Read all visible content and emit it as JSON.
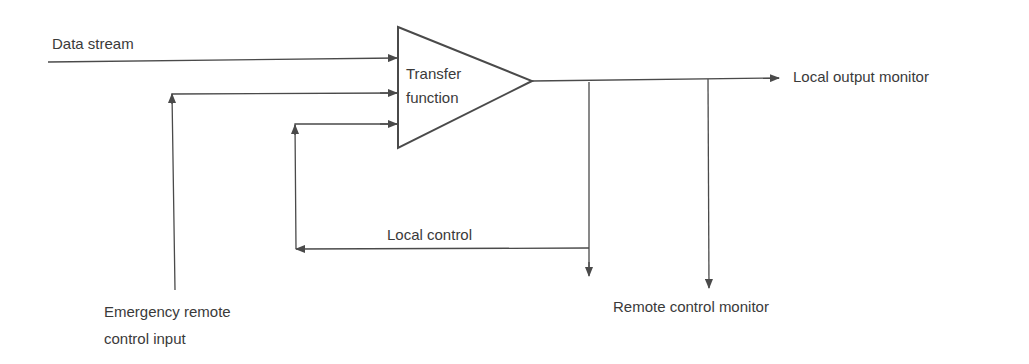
{
  "diagram": {
    "colors": {
      "line": "#4a4a4a",
      "text": "#3a3a3a",
      "background": "#ffffff"
    },
    "block": {
      "shape": "triangle",
      "label_line1": "Transfer",
      "label_line2": "function"
    },
    "labels": {
      "data_stream": "Data stream",
      "local_output_monitor": "Local output monitor",
      "local_control": "Local control",
      "remote_control_monitor": "Remote control monitor",
      "emergency_line1": "Emergency remote",
      "emergency_line2": "control input"
    },
    "connections": [
      {
        "from": "Data stream",
        "to": "Transfer function"
      },
      {
        "from": "Emergency remote control input",
        "to": "Transfer function"
      },
      {
        "from": "Local control",
        "to": "Transfer function"
      },
      {
        "from": "Transfer function",
        "to": "Local output monitor"
      },
      {
        "from": "Transfer function",
        "to": "Local control"
      },
      {
        "from": "Transfer function",
        "to": "Remote control monitor"
      }
    ]
  }
}
